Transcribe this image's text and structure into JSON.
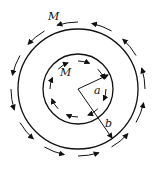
{
  "diagram": {
    "labels": {
      "outer_M": "M",
      "inner_M": "M",
      "inner_radius": "a",
      "outer_radius": "b"
    },
    "geometry": {
      "center": [
        78,
        89
      ],
      "inner_circle_radius": 35,
      "outer_circle_radius": 60,
      "inner_arrow_ring_radius": 28,
      "outer_arrow_ring_radius": 67
    },
    "arrows": {
      "inner_direction": "clockwise",
      "outer_direction": "counterclockwise",
      "inner_count": 8,
      "outer_count": 12
    },
    "colors": {
      "stroke": "#111111",
      "background": "#ffffff"
    }
  }
}
